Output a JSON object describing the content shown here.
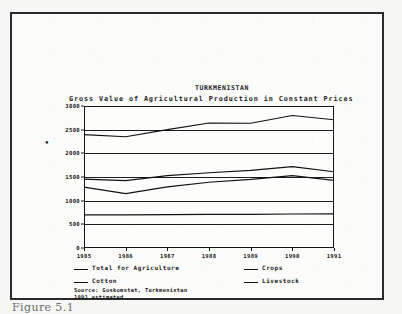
{
  "figure": {
    "caption": "Figure 5.1"
  },
  "chart_data": {
    "type": "line",
    "title": "TURKMENISTAN",
    "subtitle": "Gross Value of Agricultural Production in Constant Prices",
    "xlabel": "",
    "ylabel": "",
    "y_axis_marker": "▪",
    "x": [
      1985,
      1986,
      1987,
      1988,
      1989,
      1990,
      1991
    ],
    "categories": [
      "1985",
      "1986",
      "1987",
      "1988",
      "1989",
      "1990",
      "1991"
    ],
    "xlim": [
      1985,
      1991
    ],
    "ylim": [
      0,
      3000
    ],
    "yticks": [
      0,
      500,
      1000,
      1500,
      2000,
      2500,
      3000
    ],
    "ytick_labels": [
      "0",
      "500",
      "1000",
      "1500",
      "2000",
      "2500",
      "3000"
    ],
    "grid": true,
    "legend_position": "below",
    "series": [
      {
        "name": "Total for Agriculture",
        "values": [
          2395,
          2350,
          2500,
          2640,
          2635,
          2800,
          2710
        ]
      },
      {
        "name": "Crops",
        "values": [
          1455,
          1425,
          1530,
          1590,
          1640,
          1720,
          1610
        ]
      },
      {
        "name": "Cotton",
        "values": [
          1285,
          1150,
          1290,
          1390,
          1450,
          1530,
          1430
        ]
      },
      {
        "name": "Livestock",
        "values": [
          700,
          700,
          705,
          710,
          712,
          718,
          722
        ]
      }
    ],
    "source": {
      "line1": "Source: Goskomstat, Turkmenistan",
      "line2": "1991 estimated"
    }
  }
}
